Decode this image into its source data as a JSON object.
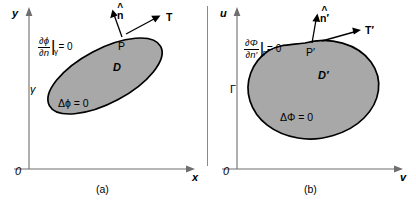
{
  "figure": {
    "background_color": "#ffffff",
    "blob_fill_color": "#a8a8a8",
    "blob_stroke_color": "#000000",
    "axis_color": "#6e6e6e"
  },
  "panels": [
    {
      "id": "a",
      "caption": "(a)",
      "origin_label": "0",
      "x_axis_label": "x",
      "y_axis_label": "y",
      "domain_label": "D",
      "boundary_label": "γ",
      "point_label": "P",
      "normal_label": "n",
      "normal_hat": "^",
      "tangent_label": "T",
      "laplace_equation": "Δϕ = 0",
      "bc": {
        "numerator": "∂ϕ",
        "denominator": "∂n",
        "bar": "|",
        "subscript": "γ",
        "rhs": "= 0"
      }
    },
    {
      "id": "b",
      "caption": "(b)",
      "origin_label": "0",
      "x_axis_label": "v",
      "y_axis_label": "u",
      "domain_label": "D′",
      "boundary_label": "Γ",
      "point_label": "P′",
      "normal_label": "n′",
      "normal_hat": "^",
      "tangent_label": "T′",
      "laplace_equation": "ΔΦ = 0",
      "bc": {
        "numerator": "∂Φ",
        "denominator": "∂n′",
        "bar": "|",
        "subscript": "Γ",
        "rhs": "= 0"
      }
    }
  ]
}
